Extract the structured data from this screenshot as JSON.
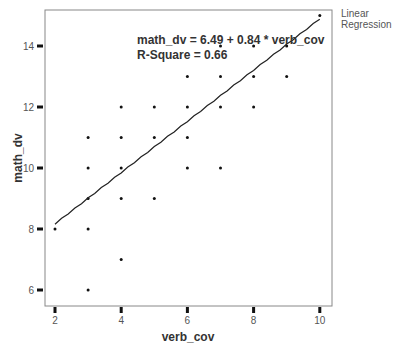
{
  "chart_data": {
    "type": "scatter",
    "title": "",
    "xlabel": "verb_cov",
    "ylabel": "math_dv",
    "xlim": [
      1.7,
      10.3
    ],
    "ylim": [
      5.5,
      15.5
    ],
    "xticks": [
      2,
      4,
      6,
      8,
      10
    ],
    "yticks": [
      6,
      8,
      10,
      12,
      14
    ],
    "grid": false,
    "legend": {
      "position": "right-top",
      "entries": [
        "Linear Regression"
      ]
    },
    "points": [
      [
        2,
        8
      ],
      [
        3,
        6
      ],
      [
        3,
        8
      ],
      [
        3,
        9
      ],
      [
        3,
        10
      ],
      [
        3,
        11
      ],
      [
        4,
        7
      ],
      [
        4,
        9
      ],
      [
        4,
        10
      ],
      [
        4,
        11
      ],
      [
        4,
        12
      ],
      [
        5,
        9
      ],
      [
        5,
        11
      ],
      [
        5,
        12
      ],
      [
        6,
        10
      ],
      [
        6,
        11
      ],
      [
        6,
        12
      ],
      [
        6,
        13
      ],
      [
        7,
        10
      ],
      [
        7,
        12
      ],
      [
        7,
        13
      ],
      [
        7,
        14
      ],
      [
        8,
        12
      ],
      [
        8,
        13
      ],
      [
        8,
        14
      ],
      [
        9,
        13
      ],
      [
        9,
        14
      ],
      [
        10,
        15
      ]
    ],
    "regression": {
      "intercept": 6.49,
      "slope": 0.84,
      "r_squared": 0.66,
      "x_range": [
        2,
        10
      ]
    },
    "annotations": [
      "math_dv = 6.49 + 0.84 * verb_cov",
      "R-Square = 0.66"
    ]
  },
  "legend_label": "Linear Regression",
  "colors": {
    "axis": "#888888",
    "points": "#111111",
    "line": "#222222",
    "text": "#333333"
  }
}
